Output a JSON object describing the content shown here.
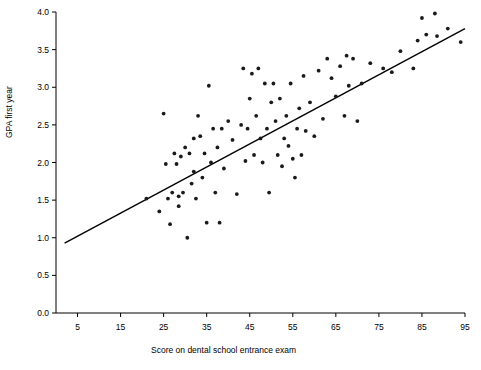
{
  "chart_data": {
    "type": "scatter",
    "title": "",
    "xlabel": "Score on dental school entrance exam",
    "ylabel": "GPA first year",
    "xlim": [
      0,
      95
    ],
    "ylim": [
      0,
      4.0
    ],
    "xticks": [
      5,
      15,
      25,
      35,
      45,
      55,
      65,
      75,
      85,
      95
    ],
    "yticks": [
      "0.0",
      "0.5",
      "1.0",
      "1.5",
      "2.0",
      "2.5",
      "3.0",
      "3.5",
      "4.0"
    ],
    "grid": false,
    "legend": "none",
    "point_color": "#1a1a1a",
    "line_color": "#000000",
    "axis_color": "#000000",
    "trendline": {
      "name": "least-squares fit",
      "x": [
        2.0,
        95.0
      ],
      "y": [
        0.93,
        3.78
      ]
    },
    "series": [
      {
        "name": "students",
        "points": [
          [
            21.0,
            1.52
          ],
          [
            24.0,
            1.35
          ],
          [
            25.0,
            2.65
          ],
          [
            25.5,
            1.98
          ],
          [
            26.0,
            1.52
          ],
          [
            26.5,
            1.18
          ],
          [
            27.0,
            1.6
          ],
          [
            27.5,
            2.12
          ],
          [
            28.0,
            1.98
          ],
          [
            28.5,
            1.55
          ],
          [
            28.5,
            1.42
          ],
          [
            29.0,
            2.08
          ],
          [
            29.5,
            1.6
          ],
          [
            30.0,
            2.2
          ],
          [
            30.5,
            1.0
          ],
          [
            31.0,
            2.12
          ],
          [
            31.5,
            1.72
          ],
          [
            32.0,
            2.32
          ],
          [
            32.0,
            1.88
          ],
          [
            32.5,
            1.52
          ],
          [
            33.0,
            2.62
          ],
          [
            33.5,
            2.35
          ],
          [
            34.0,
            1.8
          ],
          [
            34.5,
            2.12
          ],
          [
            35.0,
            1.2
          ],
          [
            35.5,
            3.02
          ],
          [
            36.0,
            2.0
          ],
          [
            36.5,
            2.45
          ],
          [
            37.0,
            1.6
          ],
          [
            37.5,
            2.2
          ],
          [
            38.0,
            1.2
          ],
          [
            38.5,
            2.45
          ],
          [
            39.0,
            1.92
          ],
          [
            40.0,
            2.55
          ],
          [
            41.0,
            2.3
          ],
          [
            42.0,
            1.58
          ],
          [
            43.0,
            2.5
          ],
          [
            43.5,
            3.25
          ],
          [
            44.0,
            2.02
          ],
          [
            44.5,
            2.45
          ],
          [
            45.0,
            2.85
          ],
          [
            45.5,
            3.18
          ],
          [
            46.0,
            2.1
          ],
          [
            46.5,
            2.62
          ],
          [
            47.0,
            3.25
          ],
          [
            47.5,
            2.32
          ],
          [
            48.0,
            2.0
          ],
          [
            48.5,
            3.05
          ],
          [
            49.0,
            2.45
          ],
          [
            49.5,
            1.6
          ],
          [
            50.0,
            2.8
          ],
          [
            50.5,
            3.05
          ],
          [
            51.0,
            2.55
          ],
          [
            51.5,
            2.1
          ],
          [
            52.0,
            2.85
          ],
          [
            52.5,
            1.95
          ],
          [
            53.0,
            2.32
          ],
          [
            53.5,
            2.62
          ],
          [
            54.0,
            2.22
          ],
          [
            54.5,
            3.05
          ],
          [
            55.0,
            2.05
          ],
          [
            55.5,
            1.8
          ],
          [
            56.0,
            2.45
          ],
          [
            56.5,
            2.72
          ],
          [
            57.0,
            2.1
          ],
          [
            57.5,
            3.15
          ],
          [
            58.0,
            2.42
          ],
          [
            59.0,
            2.8
          ],
          [
            60.0,
            2.35
          ],
          [
            61.0,
            3.22
          ],
          [
            62.0,
            2.58
          ],
          [
            63.0,
            3.38
          ],
          [
            64.0,
            3.12
          ],
          [
            65.0,
            2.88
          ],
          [
            66.0,
            3.28
          ],
          [
            67.0,
            2.62
          ],
          [
            67.5,
            3.42
          ],
          [
            68.0,
            3.02
          ],
          [
            69.0,
            3.38
          ],
          [
            70.0,
            2.55
          ],
          [
            71.0,
            3.05
          ],
          [
            73.0,
            3.32
          ],
          [
            76.0,
            3.25
          ],
          [
            78.0,
            3.2
          ],
          [
            80.0,
            3.48
          ],
          [
            83.0,
            3.25
          ],
          [
            84.0,
            3.62
          ],
          [
            85.0,
            3.92
          ],
          [
            86.0,
            3.7
          ],
          [
            88.0,
            3.98
          ],
          [
            88.5,
            3.68
          ],
          [
            91.0,
            3.78
          ],
          [
            94.0,
            3.6
          ]
        ]
      }
    ]
  }
}
